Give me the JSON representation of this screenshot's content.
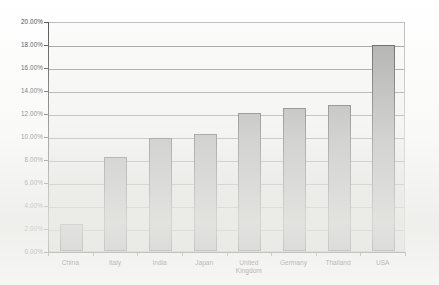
{
  "chart_data": {
    "type": "bar",
    "title": "",
    "subtitle": "",
    "xlabel": "",
    "ylabel": "",
    "categories": [
      "China",
      "Italy",
      "India",
      "Japan",
      "United\nKingdom",
      "Germany",
      "Thailand",
      "USA"
    ],
    "values": [
      2.35,
      8.2,
      9.85,
      10.2,
      12.0,
      12.4,
      12.7,
      17.9
    ],
    "value_labels": [
      "2.35%",
      "8.20%",
      "9.85%",
      "10.20%",
      "12.00%",
      "12.40%",
      "12.70%",
      "17.90%"
    ],
    "ylim": [
      0,
      20
    ],
    "ytick_values": [
      0,
      2,
      4,
      6,
      8,
      10,
      12,
      14,
      16,
      18,
      20
    ],
    "ytick_labels": [
      "0.00%",
      "2.00%",
      "4.00%",
      "6.00%",
      "8.00%",
      "10.00%",
      "12.00%",
      "14.00%",
      "16.00%",
      "18.00%",
      "20.00%"
    ],
    "grid": true,
    "grid_axis": "y",
    "legend": false,
    "legend_position": "none",
    "series": [
      {
        "name": "",
        "values": [
          2.35,
          8.2,
          9.85,
          10.2,
          12.0,
          12.4,
          12.7,
          17.9
        ]
      }
    ],
    "colors": {
      "bar_fill": "#a9a9a9",
      "bar_border": "#575757",
      "gridline": "#9a9a9a",
      "axis": "#4a4a4a",
      "plot_background": "#fcfcfc",
      "frame_border": "#b9b9b9",
      "page_background": "#ffffff",
      "text": "#3a3a3a"
    }
  }
}
